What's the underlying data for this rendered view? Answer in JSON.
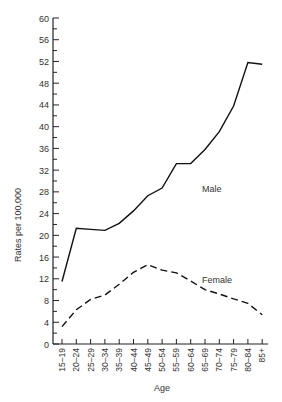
{
  "chart_data": {
    "type": "line",
    "title": "",
    "xlabel": "Age",
    "ylabel": "Rates per 100,000",
    "ylim": [
      0,
      60
    ],
    "y_major_ticks": [
      0,
      4,
      8,
      12,
      16,
      20,
      24,
      28,
      32,
      36,
      40,
      44,
      48,
      52,
      56,
      60
    ],
    "y_minor_step": 2,
    "grid": false,
    "legend": "inline labels",
    "categories": [
      "15–19",
      "20–24",
      "25–29",
      "30–34",
      "35–39",
      "40–44",
      "45–49",
      "50–54",
      "55–59",
      "60–64",
      "65–69",
      "70–74",
      "75–79",
      "80–84",
      "85+"
    ],
    "series": [
      {
        "name": "Male",
        "style": "solid",
        "values": [
          11.5,
          21.3,
          21.1,
          20.9,
          22.2,
          24.5,
          27.3,
          28.7,
          33.2,
          33.2,
          35.8,
          39.1,
          43.8,
          51.8,
          51.5
        ],
        "label_pos": {
          "x": 202,
          "y": 192
        }
      },
      {
        "name": "Female",
        "style": "dashed",
        "values": [
          3.2,
          6.3,
          8.2,
          9.0,
          11.0,
          13.2,
          14.6,
          13.6,
          13.1,
          11.6,
          10.0,
          9.2,
          8.3,
          7.5,
          5.4
        ],
        "label_pos": {
          "x": 202,
          "y": 283
        }
      }
    ],
    "colors": {
      "line": "#111111",
      "text": "#333333",
      "axis": "#222222"
    }
  }
}
